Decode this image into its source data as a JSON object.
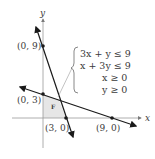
{
  "figure": {
    "axes": {
      "x_label": "x",
      "y_label": "y"
    },
    "points": [
      {
        "label": "(0, 9)",
        "x": 0,
        "y": 9
      },
      {
        "label": "(0, 3)",
        "x": 0,
        "y": 3
      },
      {
        "label": "(3, 0)",
        "x": 3,
        "y": 0
      },
      {
        "label": "(9, 0)",
        "x": 9,
        "y": 0
      }
    ],
    "lines": [
      {
        "equation": "3x + y = 9",
        "through": [
          "(0, 9)",
          "(3, 0)"
        ]
      },
      {
        "equation": "x + 3y = 9",
        "through": [
          "(0, 3)",
          "(9, 0)"
        ]
      }
    ],
    "region_marker": "F",
    "system": {
      "inequalities": [
        "3x + y ≤ 9",
        "x + 3y ≤ 9",
        "x ≥ 0",
        "y ≥ 0"
      ]
    },
    "colors": {
      "line": "#1a1a1a",
      "axis": "#9a9a9a",
      "region_fill": "#e6e6e6",
      "text": "#3a3a3a"
    }
  }
}
